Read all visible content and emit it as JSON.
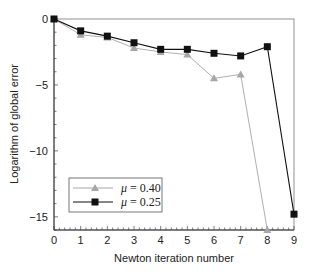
{
  "chart_data": {
    "type": "line",
    "title": "",
    "xlabel": "Newton iteration number",
    "ylabel": "Logarithm of global error",
    "xlim": [
      0,
      9
    ],
    "ylim": [
      -16,
      0
    ],
    "x_ticks": [
      0,
      1,
      2,
      3,
      4,
      5,
      6,
      7,
      8,
      9
    ],
    "y_ticks": [
      0,
      -5,
      -10,
      -15
    ],
    "x_tick_labels": [
      "0",
      "1",
      "2",
      "3",
      "4",
      "5",
      "6",
      "7",
      "8",
      "9"
    ],
    "y_tick_labels": [
      "0",
      "−5",
      "−10",
      "−15"
    ],
    "grid": false,
    "legend_position": "lower left",
    "series": [
      {
        "name": "μ = 0.40",
        "marker": "triangle",
        "color": "#a6a6a6",
        "x": [
          0,
          1,
          2,
          3,
          4,
          5,
          6,
          7,
          8
        ],
        "values": [
          0,
          -1.2,
          -1.4,
          -2.2,
          -2.5,
          -2.7,
          -4.5,
          -4.2,
          -16
        ]
      },
      {
        "name": "μ = 0.25",
        "marker": "square",
        "color": "#111111",
        "x": [
          0,
          1,
          2,
          3,
          4,
          5,
          6,
          7,
          8,
          9
        ],
        "values": [
          0,
          -0.9,
          -1.3,
          -1.8,
          -2.3,
          -2.3,
          -2.6,
          -2.8,
          -2.1,
          -14.8
        ]
      }
    ]
  },
  "legend": {
    "items": [
      {
        "symbol": "μ",
        "eq": " = 0.40"
      },
      {
        "symbol": "μ",
        "eq": " = 0.25"
      }
    ]
  }
}
